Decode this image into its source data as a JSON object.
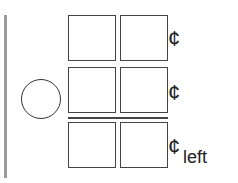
{
  "rows": [
    {
      "cent_symbol": "¢"
    },
    {
      "cent_symbol": "¢"
    },
    {
      "cent_symbol": "¢"
    }
  ],
  "left_label": "left",
  "colors": {
    "line": "#444444",
    "bar": "#9a9a9a"
  }
}
